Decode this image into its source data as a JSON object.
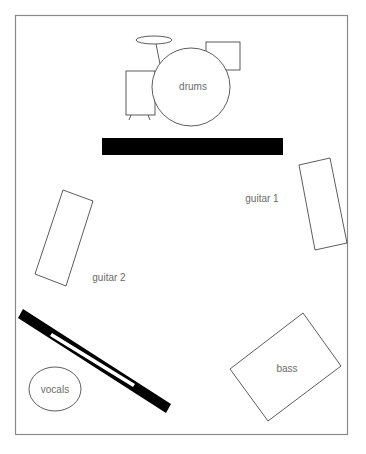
{
  "diagram": {
    "frame_color": "#8a8a8a",
    "labels": {
      "drums": "drums",
      "guitar1": "guitar 1",
      "guitar2": "guitar 2",
      "bass": "bass",
      "vocals": "vocals"
    },
    "elements": [
      {
        "id": "drums",
        "type": "drum-kit",
        "label": "drums"
      },
      {
        "id": "riser-bar",
        "type": "black-bar"
      },
      {
        "id": "guitar1-amp",
        "type": "rectangle",
        "label": "guitar 1"
      },
      {
        "id": "guitar2-amp",
        "type": "rectangle",
        "label": "guitar 2"
      },
      {
        "id": "bass-amp",
        "type": "rectangle",
        "label": "bass"
      },
      {
        "id": "vocal-monitor",
        "type": "ellipse",
        "label": "vocals"
      },
      {
        "id": "keyboard",
        "type": "black-bar-with-slot"
      }
    ]
  }
}
